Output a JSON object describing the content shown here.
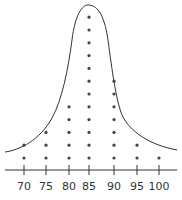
{
  "chart_data": {
    "type": "scatter",
    "subtype": "dot-plot-with-distribution-curve",
    "title": "",
    "xlabel": "",
    "ylabel": "",
    "categories": [
      "70",
      "75",
      "80",
      "85",
      "90",
      "95",
      "100"
    ],
    "values": [
      2,
      3,
      5,
      12,
      7,
      2,
      1
    ],
    "x": [
      70,
      75,
      80,
      85,
      90,
      95,
      100
    ],
    "xlim": [
      67,
      103
    ],
    "grid": false,
    "legend": null,
    "annotations": [
      "hand-drawn bell-shaped curve enclosing the dot stacks"
    ],
    "colors": {
      "ink": "#333333",
      "dots": "#444444",
      "background": "#ffffff"
    }
  }
}
